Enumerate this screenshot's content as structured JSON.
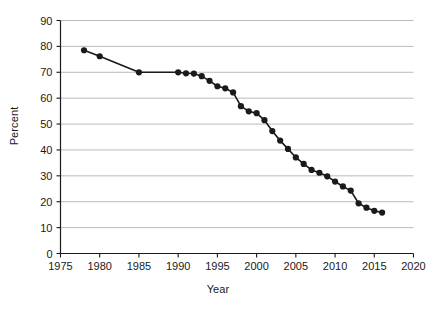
{
  "chart_data": {
    "type": "line",
    "title": "",
    "xlabel": "Year",
    "ylabel": "Percent",
    "xlim": [
      1975,
      2020
    ],
    "ylim": [
      0,
      90
    ],
    "xticks": [
      1975,
      1980,
      1985,
      1990,
      1995,
      2000,
      2005,
      2010,
      2015,
      2020
    ],
    "yticks": [
      0,
      10,
      20,
      30,
      40,
      50,
      60,
      70,
      80,
      90
    ],
    "grid": "horizontal",
    "legend": "none",
    "series": [
      {
        "name": "Percent",
        "marker": "filled-circle",
        "color": "#1a1a1a",
        "x": [
          1978,
          1980,
          1985,
          1990,
          1991,
          1992,
          1993,
          1994,
          1995,
          1996,
          1997,
          1998,
          1999,
          2000,
          2001,
          2002,
          2003,
          2004,
          2005,
          2006,
          2007,
          2008,
          2009,
          2010,
          2011,
          2012,
          2013,
          2014,
          2015,
          2016
        ],
        "values": [
          78.5,
          76.2,
          70.0,
          70.0,
          69.6,
          69.5,
          68.5,
          66.7,
          64.6,
          63.8,
          62.2,
          56.9,
          54.9,
          54.2,
          51.5,
          47.3,
          43.6,
          40.4,
          37.1,
          34.6,
          32.3,
          31.2,
          29.8,
          27.8,
          25.9,
          24.3,
          19.4,
          17.7,
          16.5,
          15.8
        ]
      }
    ]
  },
  "axes": {
    "x_title": "Year",
    "y_title": "Percent",
    "x_tick_labels": [
      "1975",
      "1980",
      "1985",
      "1990",
      "1995",
      "2000",
      "2005",
      "2010",
      "2015",
      "2020"
    ],
    "y_tick_labels": [
      "0",
      "10",
      "20",
      "30",
      "40",
      "50",
      "60",
      "70",
      "80",
      "90"
    ]
  },
  "colors": {
    "background": "#ffffff",
    "line": "#1a1a1a",
    "marker": "#1a1a1a",
    "gridline": "#a8a8a8",
    "axis": "#1a1a1a",
    "text": "#1a1a1a"
  }
}
